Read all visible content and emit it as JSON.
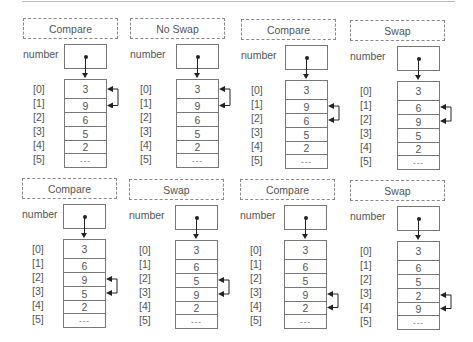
{
  "number_label": "number",
  "indices": [
    "[0]",
    "[1]",
    "[2]",
    "[3]",
    "[4]",
    "[5]"
  ],
  "colors": {
    "line": "#777777",
    "text": "#555555",
    "pointer": "#222222",
    "dashed": "#8a8a8a"
  },
  "panels": [
    {
      "label": "Compare",
      "cells": [
        "3",
        "9",
        "6",
        "5",
        "2",
        "---"
      ],
      "arrow_between": [
        0,
        1
      ]
    },
    {
      "label": "No Swap",
      "cells": [
        "3",
        "9",
        "6",
        "5",
        "2",
        "---"
      ],
      "arrow_between": [
        0,
        1
      ]
    },
    {
      "label": "Compare",
      "cells": [
        "3",
        "9",
        "6",
        "5",
        "2",
        "---"
      ],
      "arrow_between": [
        1,
        2
      ]
    },
    {
      "label": "Swap",
      "cells": [
        "3",
        "6",
        "9",
        "5",
        "2",
        "---"
      ],
      "arrow_between": [
        1,
        2
      ]
    },
    {
      "label": "Compare",
      "cells": [
        "3",
        "6",
        "9",
        "5",
        "2",
        "---"
      ],
      "arrow_between": [
        2,
        3
      ]
    },
    {
      "label": "Swap",
      "cells": [
        "3",
        "6",
        "5",
        "9",
        "2",
        "---"
      ],
      "arrow_between": [
        2,
        3
      ]
    },
    {
      "label": "Compare",
      "cells": [
        "3",
        "6",
        "5",
        "9",
        "2",
        "---"
      ],
      "arrow_between": [
        3,
        4
      ]
    },
    {
      "label": "Swap",
      "cells": [
        "3",
        "6",
        "5",
        "2",
        "9",
        "---"
      ],
      "arrow_between": [
        3,
        4
      ]
    }
  ]
}
